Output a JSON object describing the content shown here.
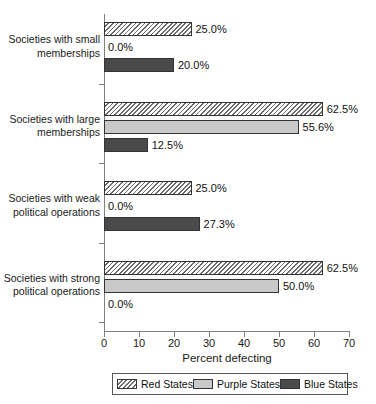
{
  "chart_data": {
    "type": "bar",
    "orientation": "horizontal",
    "title": "",
    "xlabel": "Percent defecting",
    "ylabel": "",
    "xlim": [
      0,
      70
    ],
    "xticks": [
      0,
      10,
      20,
      30,
      40,
      50,
      60,
      70
    ],
    "xtick_labels": [
      "0",
      "10",
      "20",
      "30",
      "40",
      "50",
      "60",
      "70"
    ],
    "grid": false,
    "legend_position": "bottom",
    "categories": [
      "Societies with small memberships",
      "Societies with large memberships",
      "Societies with weak political operations",
      "Societies with strong political operations"
    ],
    "category_lines": [
      [
        "Societies with small",
        "memberships"
      ],
      [
        "Societies with large",
        "memberships"
      ],
      [
        "Societies with weak",
        "political operations"
      ],
      [
        "Societies with strong",
        "political operations"
      ]
    ],
    "series": [
      {
        "name": "Red States",
        "values": [
          25.0,
          62.5,
          25.0,
          62.5
        ],
        "labels": [
          "25.0%",
          "62.5%",
          "25.0%",
          "62.5%"
        ],
        "color": "#ffffff",
        "pattern": "diagonal-hatch"
      },
      {
        "name": "Purple States",
        "values": [
          0.0,
          55.6,
          0.0,
          50.0
        ],
        "labels": [
          "0.0%",
          "55.6%",
          "0.0%",
          "50.0%"
        ],
        "color": "#c9c9c9",
        "pattern": "solid-light"
      },
      {
        "name": "Blue States",
        "values": [
          20.0,
          12.5,
          27.3,
          0.0
        ],
        "labels": [
          "20.0%",
          "12.5%",
          "27.3%",
          "0.0%"
        ],
        "color": "#4a4a4a",
        "pattern": "solid-dark"
      }
    ]
  },
  "legend": {
    "items": [
      {
        "label": "Red States",
        "swatch": "red"
      },
      {
        "label": "Purple States",
        "swatch": "purple"
      },
      {
        "label": "Blue States",
        "swatch": "blue"
      }
    ]
  },
  "axis": {
    "x_title": "Percent defecting"
  },
  "colors": {
    "axis": "#808080",
    "bar_outline": "#333333",
    "red_states": "#ffffff",
    "purple_states": "#c9c9c9",
    "blue_states": "#4a4a4a",
    "text": "#1a1a1a"
  }
}
